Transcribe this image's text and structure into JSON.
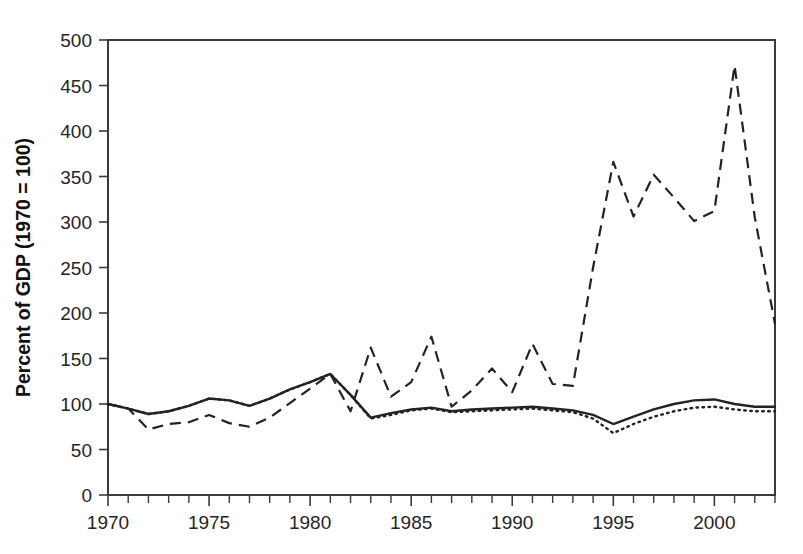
{
  "chart_data": {
    "type": "line",
    "title": "",
    "xlabel": "",
    "ylabel": "Percent of GDP (1970 = 100)",
    "xlim": [
      1970,
      2003
    ],
    "ylim": [
      0,
      500
    ],
    "ytick_step": 50,
    "xtick_major_step": 5,
    "xtick_minor_step": 1,
    "grid": false,
    "legend": "none",
    "yticks": [
      0,
      50,
      100,
      150,
      200,
      250,
      300,
      350,
      400,
      450,
      500
    ],
    "ytick_labels": [
      "0",
      "50",
      "100",
      "150",
      "200",
      "250",
      "300",
      "350",
      "400",
      "450",
      "500"
    ],
    "xticks": [
      1970,
      1975,
      1980,
      1985,
      1990,
      1995,
      2000
    ],
    "xtick_labels": [
      "1970",
      "1975",
      "1980",
      "1985",
      "1990",
      "1995",
      "2000"
    ],
    "x": [
      1970,
      1971,
      1972,
      1973,
      1974,
      1975,
      1976,
      1977,
      1978,
      1979,
      1980,
      1981,
      1982,
      1983,
      1984,
      1985,
      1986,
      1987,
      1988,
      1989,
      1990,
      1991,
      1992,
      1993,
      1994,
      1995,
      1996,
      1997,
      1998,
      1999,
      2000,
      2001,
      2002,
      2003
    ],
    "series": [
      {
        "name": "solid-series",
        "style": "solid",
        "values": [
          100,
          95,
          89,
          92,
          98,
          106,
          104,
          98,
          106,
          116,
          124,
          133,
          110,
          85,
          90,
          94,
          96,
          92,
          94,
          95,
          96,
          97,
          95,
          93,
          88,
          78,
          86,
          94,
          100,
          104,
          105,
          100,
          97,
          97
        ]
      },
      {
        "name": "dashed-series",
        "style": "dashed",
        "values": [
          100,
          95,
          72,
          78,
          80,
          88,
          79,
          75,
          85,
          101,
          117,
          133,
          92,
          162,
          108,
          124,
          174,
          97,
          115,
          139,
          113,
          166,
          122,
          120,
          250,
          366,
          306,
          352,
          327,
          301,
          312,
          472,
          305,
          188
        ]
      },
      {
        "name": "dotted-series",
        "style": "dotted",
        "values": [
          100,
          95,
          89,
          92,
          98,
          106,
          104,
          98,
          106,
          116,
          124,
          133,
          110,
          84,
          88,
          93,
          95,
          91,
          92,
          93,
          94,
          95,
          93,
          91,
          84,
          68,
          78,
          86,
          92,
          96,
          97,
          94,
          92,
          92
        ]
      }
    ]
  }
}
